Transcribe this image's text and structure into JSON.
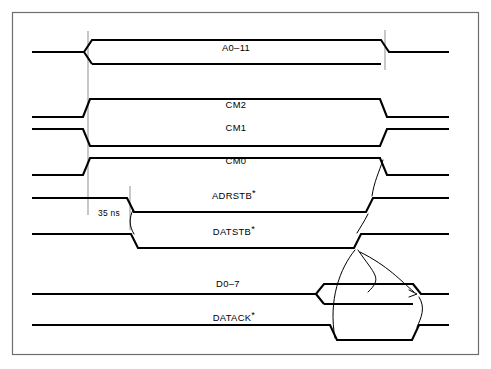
{
  "figure": {
    "kind": "timing-diagram",
    "title": "",
    "frame": {
      "x": 12,
      "y": 12,
      "width": 467,
      "height": 343,
      "stroke": "#6e6e6e"
    },
    "colors": {
      "signal": "#000000",
      "reference_line": "#9a9a9a",
      "frame": "#6e6e6e",
      "background": "#ffffff"
    }
  },
  "annotations": {
    "timing_measurement": {
      "label": "35 ns",
      "value": 35,
      "unit": "ns",
      "from_x": 88,
      "to_x": 130,
      "text_x": 109,
      "text_y": 215
    }
  },
  "reference_lines": [
    {
      "name": "t0-address-valid",
      "x": 88,
      "y1": 30,
      "y2": 215
    },
    {
      "name": "t1-strobe-assert",
      "x": 130,
      "y1": 186,
      "y2": 230
    },
    {
      "name": "t2-cycle-end",
      "x": 385,
      "y1": 30,
      "y2": 70
    }
  ],
  "signals": [
    {
      "name": "A0-11",
      "label": "A0–11",
      "label_x": 236,
      "label_y": 51,
      "star": false,
      "type": "bus",
      "baseline_y": 52,
      "row_top": 40,
      "row_bottom": 64,
      "valid_from": 88,
      "valid_to": 385,
      "description": "Address bus valid window"
    },
    {
      "name": "CM2",
      "label": "CM2",
      "label_x": 236,
      "label_y": 108,
      "star": false,
      "type": "level-high",
      "low_y": 117,
      "high_y": 99,
      "rise_x": 88,
      "fall_x": 385,
      "description": "Command bit 2, asserted high during cycle"
    },
    {
      "name": "CM1",
      "label": "CM1",
      "label_x": 236,
      "label_y": 131,
      "star": false,
      "type": "level-low",
      "high_y": 129,
      "low_y": 146,
      "fall_x": 88,
      "rise_x": 385,
      "description": "Command bit 1, asserted low during cycle"
    },
    {
      "name": "CM0",
      "label": "CM0",
      "label_x": 236,
      "label_y": 164,
      "star": false,
      "type": "level-high",
      "low_y": 175,
      "high_y": 158,
      "rise_x": 88,
      "fall_x": 385,
      "description": "Command bit 0, asserted high during cycle"
    },
    {
      "name": "ADRSTB",
      "label": "ADRSTB",
      "label_x": 236,
      "label_y": 199,
      "star": true,
      "type": "active-low-pulse",
      "high_y": 198,
      "low_y": 212,
      "fall_x": 130,
      "rise_x": 372,
      "description": "Address strobe, active low"
    },
    {
      "name": "DATSTB",
      "label": "DATSTB",
      "label_x": 236,
      "label_y": 235,
      "star": true,
      "type": "active-low-pulse",
      "high_y": 234,
      "low_y": 248,
      "fall_x": 134,
      "rise_x": 360,
      "description": "Data strobe, active low"
    },
    {
      "name": "D0-7",
      "label": "D0–7",
      "label_x": 236,
      "label_y": 287,
      "star": false,
      "type": "bus",
      "baseline_y": 294,
      "row_top": 284,
      "row_bottom": 304,
      "valid_from": 320,
      "valid_to": 420,
      "description": "Data bus valid window"
    },
    {
      "name": "DATACK",
      "label": "DATACK",
      "label_x": 236,
      "label_y": 321,
      "star": true,
      "type": "active-low-pulse",
      "high_y": 325,
      "low_y": 340,
      "fall_x": 333,
      "rise_x": 418,
      "description": "Data acknowledge, active low"
    }
  ],
  "causality_arrows": [
    {
      "name": "cm0-to-adrstb-release",
      "from": "CM0",
      "to": "ADRSTB"
    },
    {
      "name": "adrstb-to-datstb-assert",
      "from": "ADRSTB",
      "to": "DATSTB"
    },
    {
      "name": "datstb-to-datack-assert",
      "from": "DATSTB",
      "to": "DATACK"
    },
    {
      "name": "datack-to-data-valid",
      "from": "DATACK",
      "to": "D0-7"
    },
    {
      "name": "data-to-datstb-release",
      "from": "D0-7",
      "to": "DATSTB"
    },
    {
      "name": "datack-release",
      "from": "DATACK",
      "to": "D0-7"
    }
  ]
}
